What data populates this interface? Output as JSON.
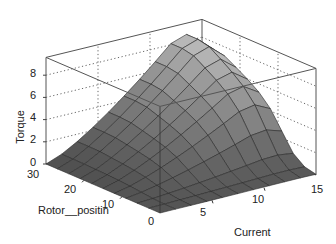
{
  "chart_data": {
    "type": "surface3d",
    "title": "",
    "xlabel": "Current",
    "ylabel": "Rotor__positin",
    "zlabel": "Torque",
    "xlim": [
      0,
      15
    ],
    "ylim": [
      0,
      30
    ],
    "zlim": [
      0,
      9.6
    ],
    "x_ticks": [
      0,
      5,
      10,
      15
    ],
    "y_ticks": [
      10,
      20,
      30
    ],
    "z_ticks": [
      0,
      2,
      4,
      6,
      8
    ],
    "grid": true,
    "colormap": "gray",
    "x": [
      0,
      1.5,
      3,
      4.5,
      6,
      7.5,
      9,
      10.5,
      12,
      13.5,
      15
    ],
    "y": [
      0,
      3,
      6,
      9,
      12,
      15,
      18,
      21,
      24,
      27,
      30
    ],
    "z_description": "Torque rises with current and rotor position; peaks ~9 near current 12-13 at high rotor position; near 0 along rotor=0 and current=0 edges; drops steeply for rotor < ~10 at high current"
  },
  "labels": {
    "z_ticks": [
      "0",
      "2",
      "4",
      "6",
      "8"
    ],
    "y_ticks": [
      "30",
      "20",
      "10",
      "0"
    ],
    "x_ticks": [
      "5",
      "10",
      "15"
    ]
  }
}
